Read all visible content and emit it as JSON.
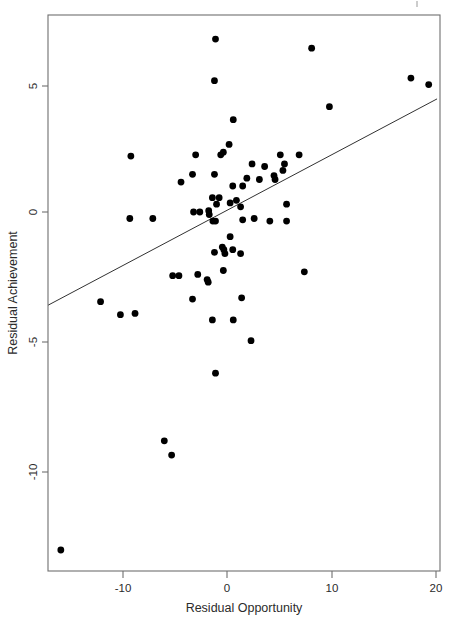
{
  "chart_data": {
    "type": "scatter",
    "title": "",
    "xlabel": "Residual Opportunity",
    "ylabel": "Residual Achievement",
    "xlim": [
      -18.1,
      20.4
    ],
    "ylim": [
      -14.3,
      7.6
    ],
    "xticks": [
      -10,
      0,
      10,
      20
    ],
    "xtick_labels": [
      "-10",
      "0",
      "10",
      "20"
    ],
    "yticks": [
      5,
      0,
      -5,
      -10
    ],
    "ytick_labels": [
      "5",
      "0",
      "-5",
      "-10"
    ],
    "grid": false,
    "legend": null,
    "marker_style": "filled-circle",
    "marker_color": "#000000",
    "points": [
      [
        -1.1,
        6.65
      ],
      [
        8.1,
        6.3
      ],
      [
        -1.2,
        5.05
      ],
      [
        17.6,
        5.15
      ],
      [
        19.3,
        4.9
      ],
      [
        9.8,
        4.05
      ],
      [
        0.6,
        3.55
      ],
      [
        0.2,
        2.6
      ],
      [
        -9.2,
        2.15
      ],
      [
        -3.0,
        2.2
      ],
      [
        -0.6,
        2.2
      ],
      [
        -0.35,
        2.3
      ],
      [
        5.1,
        2.2
      ],
      [
        6.9,
        2.2
      ],
      [
        2.4,
        1.85
      ],
      [
        3.6,
        1.75
      ],
      [
        5.5,
        1.85
      ],
      [
        5.35,
        1.6
      ],
      [
        -4.4,
        1.15
      ],
      [
        -3.3,
        1.45
      ],
      [
        -1.2,
        1.45
      ],
      [
        1.9,
        1.3
      ],
      [
        3.1,
        1.25
      ],
      [
        4.5,
        1.4
      ],
      [
        4.6,
        1.25
      ],
      [
        0.55,
        1.0
      ],
      [
        1.5,
        1.0
      ],
      [
        -1.4,
        0.55
      ],
      [
        -0.75,
        0.55
      ],
      [
        -1.0,
        0.3
      ],
      [
        0.3,
        0.35
      ],
      [
        0.9,
        0.45
      ],
      [
        1.3,
        0.2
      ],
      [
        5.7,
        0.3
      ],
      [
        -3.2,
        0.0
      ],
      [
        -2.6,
        0.0
      ],
      [
        -1.75,
        0.05
      ],
      [
        -1.7,
        -0.1
      ],
      [
        -9.3,
        -0.25
      ],
      [
        -7.1,
        -0.25
      ],
      [
        -1.35,
        -0.35
      ],
      [
        -1.1,
        -0.35
      ],
      [
        1.5,
        -0.3
      ],
      [
        2.6,
        -0.25
      ],
      [
        4.1,
        -0.35
      ],
      [
        5.7,
        -0.35
      ],
      [
        0.3,
        -0.95
      ],
      [
        -1.2,
        -1.55
      ],
      [
        -0.45,
        -1.35
      ],
      [
        -0.3,
        -1.45
      ],
      [
        -0.2,
        -1.6
      ],
      [
        0.55,
        -1.45
      ],
      [
        1.3,
        -1.6
      ],
      [
        -0.35,
        -2.25
      ],
      [
        7.4,
        -2.3
      ],
      [
        -5.2,
        -2.45
      ],
      [
        -4.6,
        -2.45
      ],
      [
        -2.8,
        -2.4
      ],
      [
        -1.9,
        -2.6
      ],
      [
        -1.8,
        -2.7
      ],
      [
        -3.3,
        -3.35
      ],
      [
        1.4,
        -3.3
      ],
      [
        -12.1,
        -3.45
      ],
      [
        -10.2,
        -3.95
      ],
      [
        -8.8,
        -3.9
      ],
      [
        -1.4,
        -4.15
      ],
      [
        0.6,
        -4.15
      ],
      [
        2.3,
        -4.95
      ],
      [
        -1.1,
        -6.2
      ],
      [
        -6.0,
        -8.8
      ],
      [
        -5.3,
        -9.35
      ],
      [
        -15.9,
        -13.0
      ]
    ],
    "fit_line": {
      "label": "regression-line",
      "x_start": -17.1,
      "y_start": -3.58,
      "x_end": 20.1,
      "y_end": 4.35
    }
  },
  "axes": {
    "x_axis_name": "Residual Opportunity",
    "y_axis_name": "Residual Achievement"
  }
}
